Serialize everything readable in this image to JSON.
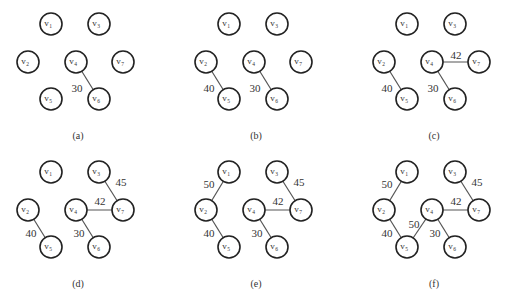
{
  "figure": {
    "node_radius": 11,
    "node_prefix": "v",
    "nodes": [
      {
        "id": "1",
        "x": 51,
        "y": 24
      },
      {
        "id": "3",
        "x": 99,
        "y": 24
      },
      {
        "id": "2",
        "x": 28,
        "y": 62
      },
      {
        "id": "4",
        "x": 76,
        "y": 62
      },
      {
        "id": "7",
        "x": 123,
        "y": 62
      },
      {
        "id": "5",
        "x": 51,
        "y": 99
      },
      {
        "id": "6",
        "x": 99,
        "y": 99
      }
    ],
    "panels": [
      {
        "caption": "(a)",
        "dx": 0,
        "dy": 0,
        "edges": [
          {
            "from": "4",
            "to": "6",
            "weight": "30",
            "lx": 77,
            "ly": 92
          }
        ]
      },
      {
        "caption": "(b)",
        "dx": 178,
        "dy": 0,
        "edges": [
          {
            "from": "2",
            "to": "5",
            "weight": "40",
            "lx": 31,
            "ly": 92
          },
          {
            "from": "4",
            "to": "6",
            "weight": "30",
            "lx": 77,
            "ly": 92
          }
        ]
      },
      {
        "caption": "(c)",
        "dx": 356,
        "dy": 0,
        "edges": [
          {
            "from": "2",
            "to": "5",
            "weight": "40",
            "lx": 31,
            "ly": 92
          },
          {
            "from": "4",
            "to": "6",
            "weight": "30",
            "lx": 77,
            "ly": 92
          },
          {
            "from": "4",
            "to": "7",
            "weight": "42",
            "lx": 100,
            "ly": 59
          }
        ]
      },
      {
        "caption": "(d)",
        "dx": 0,
        "dy": 148,
        "edges": [
          {
            "from": "2",
            "to": "5",
            "weight": "40",
            "lx": 31,
            "ly": 89
          },
          {
            "from": "4",
            "to": "6",
            "weight": "30",
            "lx": 79,
            "ly": 89
          },
          {
            "from": "4",
            "to": "7",
            "weight": "42",
            "lx": 100,
            "ly": 57
          },
          {
            "from": "3",
            "to": "7",
            "weight": "45",
            "lx": 121,
            "ly": 38
          }
        ]
      },
      {
        "caption": "(e)",
        "dx": 178,
        "dy": 148,
        "edges": [
          {
            "from": "2",
            "to": "5",
            "weight": "40",
            "lx": 31,
            "ly": 89
          },
          {
            "from": "4",
            "to": "6",
            "weight": "30",
            "lx": 79,
            "ly": 89
          },
          {
            "from": "4",
            "to": "7",
            "weight": "42",
            "lx": 100,
            "ly": 57
          },
          {
            "from": "3",
            "to": "7",
            "weight": "45",
            "lx": 121,
            "ly": 38
          },
          {
            "from": "1",
            "to": "2",
            "weight": "50",
            "lx": 31,
            "ly": 40
          }
        ]
      },
      {
        "caption": "(f)",
        "dx": 356,
        "dy": 148,
        "edges": [
          {
            "from": "2",
            "to": "5",
            "weight": "40",
            "lx": 31,
            "ly": 89
          },
          {
            "from": "4",
            "to": "6",
            "weight": "30",
            "lx": 79,
            "ly": 89
          },
          {
            "from": "4",
            "to": "7",
            "weight": "42",
            "lx": 100,
            "ly": 57
          },
          {
            "from": "3",
            "to": "7",
            "weight": "45",
            "lx": 121,
            "ly": 38
          },
          {
            "from": "1",
            "to": "2",
            "weight": "50",
            "lx": 31,
            "ly": 40
          },
          {
            "from": "4",
            "to": "5",
            "weight": "50",
            "lx": 58,
            "ly": 80
          }
        ]
      }
    ],
    "caption_x": 78,
    "caption_y": 139
  }
}
